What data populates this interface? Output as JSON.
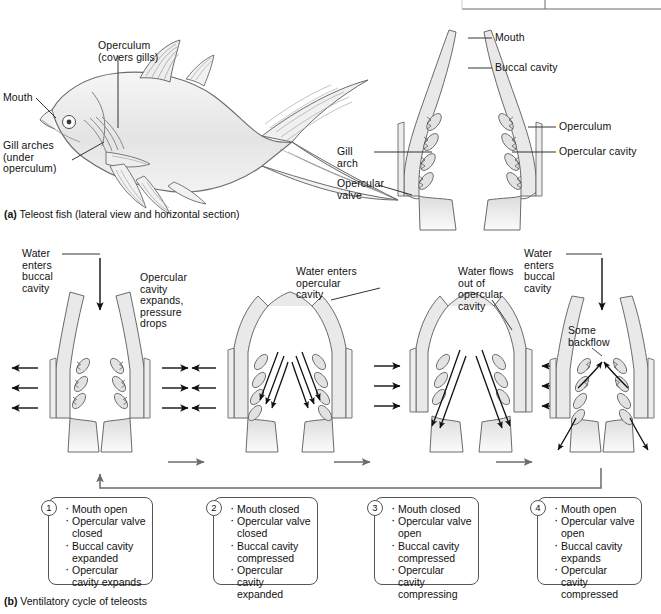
{
  "figure": {
    "panel_a_caption_tag": "(a)",
    "panel_a_caption": " Teleost fish (lateral view and horizontal section)",
    "panel_b_caption_tag": "(b)",
    "panel_b_caption": " Ventilatory cycle of teleosts"
  },
  "colors": {
    "tissue_fill": "#e9e9e9",
    "tissue_stroke": "#6a6a6a",
    "line": "#333333",
    "arrow": "#111111",
    "box_border": "#555555",
    "flow_arrow_gray": "#6b6b6b",
    "background": "#ffffff"
  },
  "fish_labels": {
    "operculum": "Operculum\n(covers gills)",
    "mouth": "Mouth",
    "gill_arches": "Gill arches\n(under\noperculum)"
  },
  "section_labels": {
    "mouth": "Mouth",
    "buccal_cavity": "Buccal cavity",
    "operculum": "Operculum",
    "opercular_cavity": "Opercular cavity",
    "gill_arch": "Gill\narch",
    "opercular_valve": "Opercular\nvalve"
  },
  "cycle_annotations": {
    "stage1": "Water\nenters\nbuccal\ncavity",
    "stage1b": "Opercular\ncavity\nexpands,\npressure\ndrops",
    "stage2": "Water enters\nopercular\ncavity",
    "stage3": "Water flows\nout of\nopercular\ncavity",
    "stage4": "Water\nenters\nbuccal\ncavity",
    "stage4b": "Some\nbackflow"
  },
  "steps": [
    {
      "number": "1",
      "items": [
        "Mouth open",
        "Opercular valve closed",
        "Buccal cavity expanded",
        "Opercular cavity expands"
      ]
    },
    {
      "number": "2",
      "items": [
        "Mouth closed",
        "Opercular valve closed",
        "Buccal cavity compressed",
        "Opercular cavity expanded"
      ]
    },
    {
      "number": "3",
      "items": [
        "Mouth closed",
        "Opercular valve open",
        "Buccal cavity compressed",
        "Opercular cavity compressing"
      ]
    },
    {
      "number": "4",
      "items": [
        "Mouth open",
        "Opercular valve open",
        "Buccal cavity expands",
        "Opercular cavity compressed"
      ]
    }
  ]
}
